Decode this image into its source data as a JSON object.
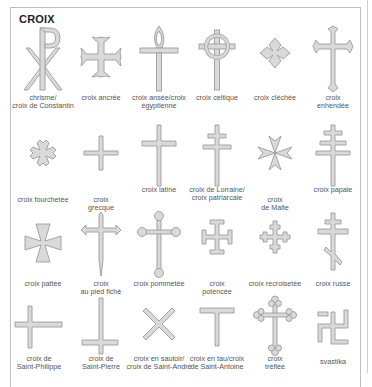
{
  "title": "CROIX",
  "colors": {
    "cross_fill": "#d9d9d9",
    "cross_edge": "#9c9c9c",
    "label_text": "#555555",
    "frame": "#bdbdbd"
  },
  "rows": [
    [
      {
        "icon": "chi-rho-icon",
        "label": [
          "chrisme/",
          "croix de Constantin"
        ]
      },
      {
        "icon": "anchored-cross-icon",
        "label": [
          "croix ancrée"
        ]
      },
      {
        "icon": "ankh-icon",
        "label": [
          "croix ansée/croix",
          "égyptienne"
        ]
      },
      {
        "icon": "celtic-cross-icon",
        "label": [
          "croix celtique"
        ]
      },
      {
        "icon": "clechee-cross-icon",
        "label": [
          "croix cléchée"
        ]
      },
      {
        "icon": "enhendee-cross-icon",
        "label": [
          "croix",
          "enhendée"
        ]
      }
    ],
    [
      {
        "icon": "fourchetee-cross-icon",
        "label": [
          "croix fourchetée"
        ]
      },
      {
        "icon": "greek-cross-icon",
        "label": [
          "croix",
          "grecque"
        ]
      },
      {
        "icon": "latin-cross-icon",
        "label": [
          "croix latine"
        ]
      },
      {
        "icon": "lorraine-cross-icon",
        "label": [
          "croix de Lorraine/",
          "croix patriarcale"
        ]
      },
      {
        "icon": "maltese-cross-icon",
        "label": [
          "croix",
          "de Malte"
        ]
      },
      {
        "icon": "papal-cross-icon",
        "label": [
          "croix papale"
        ]
      }
    ],
    [
      {
        "icon": "pattee-cross-icon",
        "label": [
          "croix pattée"
        ]
      },
      {
        "icon": "fitchee-cross-icon",
        "label": [
          "croix",
          "au pied fiché"
        ]
      },
      {
        "icon": "pommee-cross-icon",
        "label": [
          "croix pommetée"
        ]
      },
      {
        "icon": "potent-cross-icon",
        "label": [
          "croix",
          "potencée"
        ]
      },
      {
        "icon": "crosslet-cross-icon",
        "label": [
          "croix recroisetée"
        ]
      },
      {
        "icon": "russian-cross-icon",
        "label": [
          "croix russe"
        ]
      }
    ],
    [
      {
        "icon": "saint-philip-cross-icon",
        "label": [
          "croix de",
          "Saint-Philippe"
        ]
      },
      {
        "icon": "saint-peter-cross-icon",
        "label": [
          "croix de",
          "Saint-Pierre"
        ]
      },
      {
        "icon": "saltire-cross-icon",
        "label": [
          "croix en sautoir/",
          "croix de Saint-André"
        ]
      },
      {
        "icon": "tau-cross-icon",
        "label": [
          "croix en tau/croix",
          "de Saint-Antoine"
        ]
      },
      {
        "icon": "trefle-cross-icon",
        "label": [
          "croix",
          "tréflée"
        ]
      },
      {
        "icon": "swastika-icon",
        "label": [
          "svastika"
        ]
      }
    ]
  ]
}
